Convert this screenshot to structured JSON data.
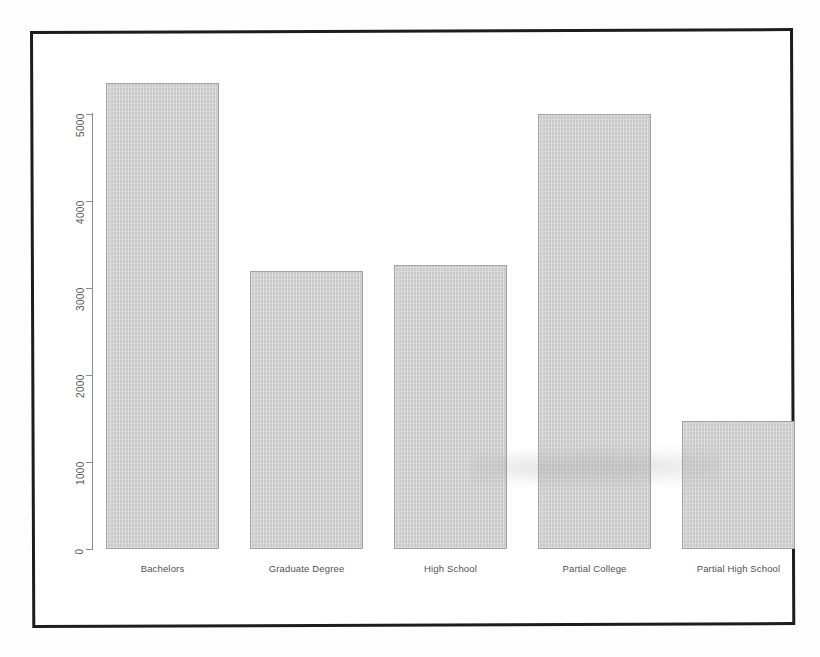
{
  "chart_data": {
    "type": "bar",
    "title": "",
    "subtitle": "",
    "xlabel": "",
    "ylabel": "",
    "categories": [
      "Bachelors",
      "Graduate Degree",
      "High School",
      "Partial College",
      "Partial High School"
    ],
    "values": [
      5360,
      3190,
      3270,
      5000,
      1470
    ],
    "ytick_labels": [
      "0",
      "1000",
      "2000",
      "3000",
      "4000",
      "5000"
    ],
    "ytick_values": [
      0,
      1000,
      2000,
      3000,
      4000,
      5000
    ],
    "ylim": [
      0,
      5600
    ],
    "grid": false,
    "legend": null,
    "legend_position": "none",
    "bar_fill_color": "#cfcfcf",
    "bar_border_color": "#a3a3a3",
    "axis_color": "#8c8c8c",
    "frame_color": "#1d1d1d",
    "background_color": "#ffffff",
    "annotations": []
  },
  "figure": {
    "frame_label": "scanned-page-border",
    "media": "scanned document page"
  }
}
